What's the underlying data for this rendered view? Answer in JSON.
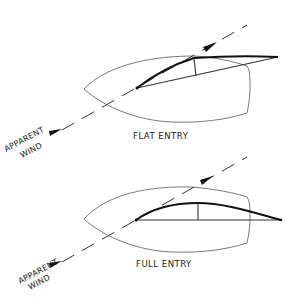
{
  "diagrams": [
    {
      "id": "flat",
      "caption": "FLAT ENTRY",
      "wind_label_line1": "APPARENT",
      "wind_label_line2": "WIND"
    },
    {
      "id": "full",
      "caption": "FULL ENTRY",
      "wind_label_line1": "APPARENT",
      "wind_label_line2": "WIND"
    }
  ],
  "colors": {
    "hull": "#6a6a6a",
    "sail": "#111111",
    "background": "#ffffff"
  }
}
